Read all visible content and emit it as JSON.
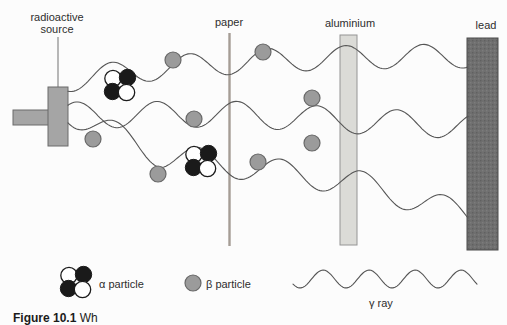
{
  "labels": {
    "source_line1": "radioactive",
    "source_line2": "source",
    "paper": "paper",
    "aluminium": "aluminium",
    "lead": "lead"
  },
  "legend": {
    "alpha": "α particle",
    "beta": "β particle",
    "gamma": "γ ray"
  },
  "caption": {
    "prefix": "Figure 10.1",
    "rest": " Wh"
  },
  "colors": {
    "source_fill": "#a5a5a5",
    "beta_fill": "#9b9b9b",
    "alpha_black": "#1a1a1a",
    "alpha_white": "#ffffff",
    "paper_line": "#a59d95",
    "aluminium_fill": "#dbdbd7",
    "lead_fill": "#6f6f6f",
    "lead_texture_dark": "#606060",
    "lead_texture_light": "#7c7c7c",
    "wave_stroke": "#555555"
  },
  "diagram": {
    "beta_positions": [
      [
        173,
        60
      ],
      [
        263,
        52
      ],
      [
        93,
        139
      ],
      [
        194,
        119
      ],
      [
        158,
        174
      ],
      [
        258,
        162
      ],
      [
        312,
        98
      ],
      [
        312,
        143
      ]
    ],
    "alpha_cluster_positions": [
      [
        120,
        85
      ],
      [
        201,
        161
      ]
    ],
    "gamma_waves": [
      {
        "x0": 68,
        "x1": 468,
        "amp": 12,
        "lambda": 78,
        "phase": 1.2,
        "midline": [
          [
            68,
            80
          ],
          [
            160,
            68
          ],
          [
            250,
            61
          ],
          [
            360,
            57
          ],
          [
            468,
            56
          ]
        ]
      },
      {
        "x0": 68,
        "x1": 468,
        "amp": 13,
        "lambda": 80,
        "phase": 4.0,
        "midline": [
          [
            68,
            115
          ],
          [
            230,
            114
          ],
          [
            360,
            121
          ],
          [
            468,
            126
          ]
        ]
      },
      {
        "x0": 68,
        "x1": 468,
        "amp": 13,
        "lambda": 82,
        "phase": 1.0,
        "midline": [
          [
            68,
            112
          ],
          [
            160,
            155
          ],
          [
            230,
            165
          ],
          [
            358,
            183
          ],
          [
            468,
            215
          ]
        ]
      }
    ],
    "gamma_legend_wave": {
      "x0": 293,
      "x1": 477,
      "amp": 9,
      "lambda": 46,
      "phase": 0.6,
      "midline": [
        [
          293,
          279
        ],
        [
          477,
          279
        ]
      ]
    }
  }
}
